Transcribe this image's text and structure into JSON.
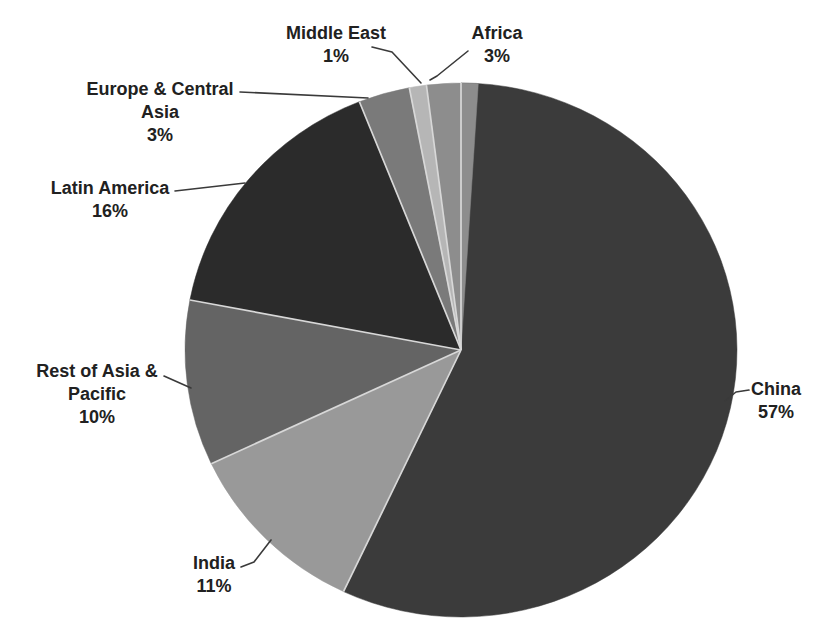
{
  "page": {
    "background": "#ffffff"
  },
  "chart_data": {
    "type": "pie",
    "title": "",
    "start_angle_deg": 0,
    "direction": "clockwise",
    "legend": "none",
    "label_style": "outside-with-leader-lines",
    "unit": "%",
    "categories": [
      "China",
      "India",
      "Rest of Asia & Pacific",
      "Latin America",
      "Europe & Central Asia",
      "Middle East",
      "Africa"
    ],
    "values": [
      57,
      11,
      10,
      16,
      3,
      1,
      3
    ],
    "points": [
      {
        "label": "China",
        "value": 57,
        "pct": "57%",
        "color": "#3b3b3b"
      },
      {
        "label": "India",
        "value": 11,
        "pct": "11%",
        "color": "#999999"
      },
      {
        "label": "Rest of Asia & Pacific",
        "value": 10,
        "pct": "10%",
        "color": "#646464"
      },
      {
        "label": "Latin America",
        "value": 16,
        "pct": "16%",
        "color": "#2b2b2b"
      },
      {
        "label": "Europe & Central Asia",
        "value": 3,
        "pct": "3%",
        "color": "#7a7a7a"
      },
      {
        "label": "Middle East",
        "value": 1,
        "pct": "1%",
        "color": "#b6b6b6"
      },
      {
        "label": "Africa",
        "value": 3,
        "pct": "3%",
        "color": "#8d8d8d"
      }
    ],
    "separator_color": "#d8d8d8",
    "leader_line_color": "#3a3a3a",
    "text_color": "#212121"
  }
}
